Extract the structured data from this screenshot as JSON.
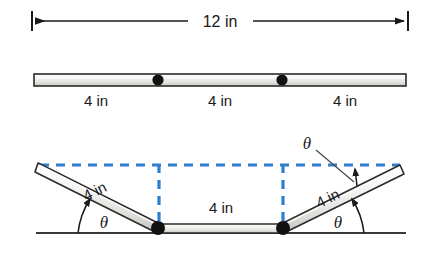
{
  "figure": {
    "colors": {
      "ink": "#1a1a1a",
      "rule_fill_light": "#f2f1ef",
      "rule_fill_mid": "#d9d7d3",
      "rule_outline": "#2b2b2b",
      "joint": "#111111",
      "dashed_blue": "#2f7fd0",
      "ground": "#3a3a3a",
      "background": "#ffffff"
    },
    "top_dimension": {
      "label": "12 in",
      "arrow_style": "double-headed-with-end-ticks",
      "x_start": 32,
      "x_end": 408,
      "y": 21
    },
    "straight_ruler": {
      "segments": [
        {
          "label": "4 in",
          "center_x": 96
        },
        {
          "label": "4 in",
          "center_x": 220
        },
        {
          "label": "4 in",
          "center_x": 345
        }
      ],
      "joint_dots_x": [
        158,
        282
      ],
      "bar_left": 34,
      "bar_right": 406,
      "bar_top": 74,
      "bar_bottom": 86,
      "label_y": 100
    },
    "folded_ruler": {
      "left_arm_label": "4 in",
      "middle_label": "4 in",
      "right_arm_label": "4 in",
      "angle_labels": {
        "left": "θ",
        "right": "θ",
        "top": "θ"
      },
      "joints": [
        {
          "x": 158,
          "y": 228
        },
        {
          "x": 283,
          "y": 228
        }
      ],
      "left_arm_tip": {
        "x": 38,
        "y": 168
      },
      "right_arm_tip": {
        "x": 400,
        "y": 170
      },
      "dashed_top_y": 165,
      "dashed_x_left": 40,
      "dashed_x_right": 400,
      "ground_y": 233,
      "ground_x_start": 36,
      "ground_x_end": 406
    }
  }
}
